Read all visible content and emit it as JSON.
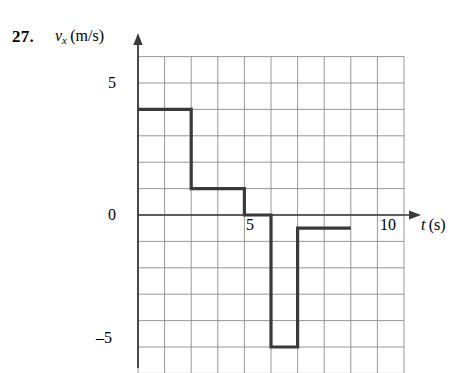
{
  "problem": {
    "number": "27."
  },
  "axes": {
    "y_axis_label": "v",
    "y_axis_subscript": "x",
    "y_axis_units": "(m/s)",
    "x_axis_label": "t",
    "x_axis_units": "(s)",
    "y_ticks": [
      {
        "value": 5,
        "label": "5"
      },
      {
        "value": 0,
        "label": "0"
      },
      {
        "value": -5,
        "label": "–5"
      }
    ],
    "x_ticks": [
      {
        "value": 5,
        "label": "5"
      },
      {
        "value": 10,
        "label": "10"
      }
    ]
  },
  "colors": {
    "curve": "#3a3a3a",
    "grid": "#8c8c8c",
    "axis": "#3a3a3a",
    "text": "#000000",
    "background": "#ffffff"
  },
  "chart_data": {
    "type": "line",
    "title": "",
    "xlabel": "t (s)",
    "ylabel": "v_x (m/s)",
    "xlim": [
      0,
      11
    ],
    "ylim": [
      -6,
      7
    ],
    "grid": true,
    "legend": "none",
    "x": [
      0,
      2,
      2,
      4,
      4,
      5,
      5,
      6,
      6,
      8
    ],
    "y": [
      4,
      4,
      1,
      1,
      0,
      0,
      -5,
      -5,
      -0.5,
      -0.5
    ],
    "segments": [
      {
        "t_start": 0,
        "t_end": 2,
        "v": 4
      },
      {
        "t_start": 2,
        "t_end": 4,
        "v": 1
      },
      {
        "t_start": 4,
        "t_end": 5,
        "v": 0
      },
      {
        "t_start": 5,
        "t_end": 6,
        "v": -5
      },
      {
        "t_start": 6,
        "t_end": 8,
        "v": -0.5
      }
    ]
  }
}
